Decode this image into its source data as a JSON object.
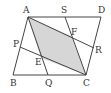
{
  "diagram": {
    "type": "geometry",
    "colors": {
      "line": "#444444",
      "shade": "#d6d6d6",
      "label": "#333333"
    },
    "labels": {
      "A": "A",
      "B": "B",
      "C": "C",
      "D": "D",
      "P": "P",
      "Q": "Q",
      "R": "R",
      "S": "S",
      "E": "E",
      "F": "F"
    },
    "points": {
      "A": [
        28,
        17
      ],
      "D": [
        101,
        17
      ],
      "B": [
        13,
        75
      ],
      "C": [
        86,
        75
      ],
      "S": [
        65,
        17
      ],
      "P": [
        20,
        47
      ],
      "Q": [
        48,
        75
      ],
      "R": [
        94,
        48
      ],
      "E": [
        41,
        58
      ],
      "F": [
        71,
        36
      ]
    },
    "segments": [
      [
        "A",
        "D"
      ],
      [
        "D",
        "C"
      ],
      [
        "C",
        "B"
      ],
      [
        "B",
        "A"
      ],
      [
        "A",
        "Q"
      ],
      [
        "S",
        "C"
      ],
      [
        "A",
        "R"
      ],
      [
        "P",
        "C"
      ]
    ],
    "shaded_region": [
      "A",
      "F",
      "C",
      "E"
    ]
  }
}
